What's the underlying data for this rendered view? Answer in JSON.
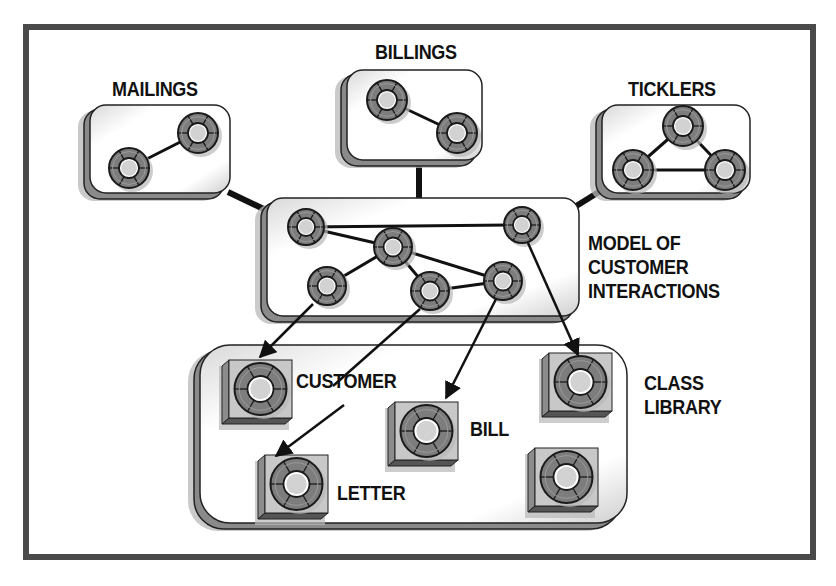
{
  "colors": {
    "frame": "#4a4a4a",
    "panel_fill": "#ffffff",
    "panel_border": "#222222",
    "panel_depth": "#8a8a8a",
    "shadow": "#b8b8b8",
    "node_ring": "#7d7d7d",
    "node_core": "#d2d2d2",
    "node_outline": "#1a1a1a",
    "connector": "#111111",
    "tile_face": "#c8c8c8",
    "tile_side": "#8c8c8c"
  },
  "labels": {
    "mailings": "MAILINGS",
    "billings": "BILLINGS",
    "ticklers": "TICKLERS",
    "model": "MODEL OF\nCUSTOMER\nINTERACTIONS",
    "customer": "CUSTOMER",
    "bill": "BILL",
    "letter": "LETTER",
    "class_library": "CLASS\nLIBRARY"
  },
  "panels": [
    {
      "id": "mailings",
      "x": 90,
      "y": 105,
      "w": 140,
      "h": 90
    },
    {
      "id": "billings",
      "x": 347,
      "y": 70,
      "w": 135,
      "h": 92
    },
    {
      "id": "ticklers",
      "x": 602,
      "y": 105,
      "w": 148,
      "h": 90
    },
    {
      "id": "model",
      "x": 267,
      "y": 198,
      "w": 312,
      "h": 120
    },
    {
      "id": "class-library",
      "x": 200,
      "y": 345,
      "w": 427,
      "h": 180
    }
  ],
  "panel_links": [
    {
      "x1": 228,
      "y1": 192,
      "x2": 270,
      "y2": 212
    },
    {
      "x1": 419,
      "y1": 162,
      "x2": 419,
      "y2": 198
    },
    {
      "x1": 602,
      "y1": 190,
      "x2": 565,
      "y2": 213
    }
  ],
  "nodes": [
    {
      "group": "mailings",
      "cx": 129,
      "cy": 168,
      "r": 20
    },
    {
      "group": "mailings",
      "cx": 198,
      "cy": 133,
      "r": 20
    },
    {
      "group": "billings",
      "cx": 387,
      "cy": 100,
      "r": 20
    },
    {
      "group": "billings",
      "cx": 457,
      "cy": 133,
      "r": 20
    },
    {
      "group": "ticklers",
      "cx": 683,
      "cy": 126,
      "r": 20
    },
    {
      "group": "ticklers",
      "cx": 633,
      "cy": 170,
      "r": 20
    },
    {
      "group": "ticklers",
      "cx": 725,
      "cy": 170,
      "r": 20
    },
    {
      "group": "model",
      "cx": 306,
      "cy": 227,
      "r": 18
    },
    {
      "group": "model",
      "cx": 393,
      "cy": 247,
      "r": 19
    },
    {
      "group": "model",
      "cx": 522,
      "cy": 225,
      "r": 18
    },
    {
      "group": "model",
      "cx": 327,
      "cy": 286,
      "r": 19
    },
    {
      "group": "model",
      "cx": 430,
      "cy": 291,
      "r": 19
    },
    {
      "group": "model",
      "cx": 503,
      "cy": 281,
      "r": 19
    }
  ],
  "node_links": [
    {
      "a": 0,
      "b": 1
    },
    {
      "a": 2,
      "b": 3
    },
    {
      "a": 4,
      "b": 5
    },
    {
      "a": 4,
      "b": 6
    },
    {
      "a": 5,
      "b": 6
    },
    {
      "a": 7,
      "b": 9
    },
    {
      "a": 7,
      "b": 8
    },
    {
      "a": 8,
      "b": 10
    },
    {
      "a": 8,
      "b": 11
    },
    {
      "a": 8,
      "b": 12
    },
    {
      "a": 11,
      "b": 12
    }
  ],
  "arrows": [
    {
      "from": "model-node-left-bottom",
      "x1": 313,
      "y1": 304,
      "x2": 260,
      "y2": 357
    },
    {
      "from": "model-node-center-bottom",
      "x1": 420,
      "y1": 309,
      "x2": 333,
      "y2": 386,
      "stub_only": true
    },
    {
      "from": "model-node-center-bottom-continued",
      "x1": 344,
      "y1": 405,
      "x2": 276,
      "y2": 456
    },
    {
      "from": "model-node-right-bottom",
      "x1": 496,
      "y1": 299,
      "x2": 446,
      "y2": 398
    },
    {
      "from": "model-node-right-top",
      "x1": 528,
      "y1": 243,
      "x2": 578,
      "y2": 355
    }
  ],
  "tiles": [
    {
      "name": "customer",
      "x": 222,
      "y": 360,
      "size": 70
    },
    {
      "name": "bill",
      "x": 388,
      "y": 402,
      "size": 70
    },
    {
      "name": "letter",
      "x": 258,
      "y": 455,
      "size": 70
    },
    {
      "name": "class-top-right",
      "x": 542,
      "y": 353,
      "size": 70
    },
    {
      "name": "class-bottom-right",
      "x": 528,
      "y": 448,
      "size": 70
    }
  ]
}
